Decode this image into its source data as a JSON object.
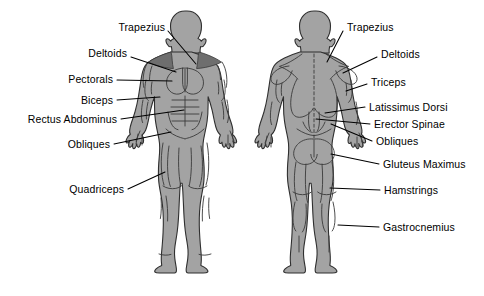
{
  "diagram": {
    "colors": {
      "body_fill": "#a3a3a3",
      "body_outline": "#2f2f2f",
      "muscle_shade": "#8d8d8d",
      "leader_line": "#000000",
      "background": "#ffffff",
      "label_text": "#000000"
    },
    "figures": [
      {
        "id": "anterior",
        "name": "front-view-figure",
        "view": "anterior"
      },
      {
        "id": "posterior",
        "name": "back-view-figure",
        "view": "posterior"
      }
    ]
  },
  "labels": {
    "left": [
      {
        "id": "trapezius-front",
        "text": "Trapezius",
        "text_x": 165,
        "text_y": 27,
        "leader": [
          [
            168,
            31
          ],
          [
            196,
            64
          ]
        ]
      },
      {
        "id": "deltoids-front",
        "text": "Deltoids",
        "text_x": 127,
        "text_y": 53,
        "leader": [
          [
            131,
            57
          ],
          [
            176,
            72
          ]
        ]
      },
      {
        "id": "pectorals-front",
        "text": "Pectorals",
        "text_x": 113,
        "text_y": 79,
        "leader": [
          [
            117,
            80
          ],
          [
            172,
            81
          ]
        ]
      },
      {
        "id": "biceps-front",
        "text": "Biceps",
        "text_x": 113,
        "text_y": 100,
        "leader": [
          [
            117,
            100
          ],
          [
            160,
            97
          ]
        ]
      },
      {
        "id": "rectus-abdominus-front",
        "text": "Rectus Abdominus",
        "text_x": 117,
        "text_y": 119,
        "leader": [
          [
            121,
            119
          ],
          [
            184,
            110
          ]
        ]
      },
      {
        "id": "obliques-front",
        "text": "Obliques",
        "text_x": 110,
        "text_y": 144,
        "leader": [
          [
            114,
            144
          ],
          [
            171,
            132
          ]
        ]
      },
      {
        "id": "quadriceps-front",
        "text": "Quadriceps",
        "text_x": 124,
        "text_y": 189,
        "leader": [
          [
            128,
            189
          ],
          [
            165,
            172
          ]
        ]
      }
    ],
    "right": [
      {
        "id": "trapezius-back",
        "text": "Trapezius",
        "text_x": 347,
        "text_y": 27,
        "leader": [
          [
            343,
            31
          ],
          [
            327,
            62
          ]
        ]
      },
      {
        "id": "deltoids-back",
        "text": "Deltoids",
        "text_x": 381,
        "text_y": 54,
        "leader": [
          [
            377,
            57
          ],
          [
            343,
            73
          ]
        ]
      },
      {
        "id": "triceps-back",
        "text": "Triceps",
        "text_x": 371,
        "text_y": 82,
        "leader": [
          [
            367,
            84
          ],
          [
            346,
            91
          ]
        ]
      },
      {
        "id": "latissimus-dorsi-back",
        "text": "Latissimus Dorsi",
        "text_x": 369,
        "text_y": 107,
        "leader": [
          [
            365,
            107
          ],
          [
            325,
            113
          ]
        ]
      },
      {
        "id": "erector-spinae-back",
        "text": "Erector Spinae",
        "text_x": 374,
        "text_y": 124,
        "leader": [
          [
            370,
            124
          ],
          [
            316,
            119
          ]
        ]
      },
      {
        "id": "obliques-back",
        "text": "Obliques",
        "text_x": 376,
        "text_y": 141,
        "leader": [
          [
            372,
            141
          ],
          [
            331,
            124
          ]
        ]
      },
      {
        "id": "gluteus-maximus-back",
        "text": "Gluteus Maximus",
        "text_x": 383,
        "text_y": 164,
        "leader": [
          [
            379,
            164
          ],
          [
            331,
            154
          ]
        ]
      },
      {
        "id": "hamstrings-back",
        "text": "Hamstrings",
        "text_x": 384,
        "text_y": 190,
        "leader": [
          [
            380,
            190
          ],
          [
            330,
            188
          ]
        ]
      },
      {
        "id": "gastrocnemius-back",
        "text": "Gastrocnemius",
        "text_x": 383,
        "text_y": 227,
        "leader": [
          [
            379,
            227
          ],
          [
            338,
            225
          ]
        ]
      }
    ]
  }
}
